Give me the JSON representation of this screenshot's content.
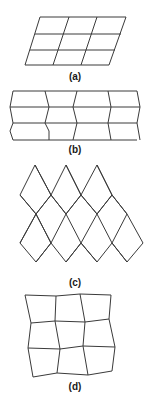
{
  "figure": {
    "panels": [
      {
        "id": "a",
        "label": "(a)",
        "description": "3x3 grid of parallelograms (sheared lattice)",
        "label_pos": [
          75,
          77
        ],
        "lines": [
          [
            [
              40,
              17
            ],
            [
              126,
              17
            ]
          ],
          [
            [
              35,
              34
            ],
            [
              121,
              34
            ]
          ],
          [
            [
              30,
              50
            ],
            [
              115,
              50
            ]
          ],
          [
            [
              25,
              65
            ],
            [
              109,
              65
            ]
          ],
          [
            [
              40,
              17
            ],
            [
              25,
              65
            ]
          ],
          [
            [
              69,
              17
            ],
            [
              53,
              65
            ]
          ],
          [
            [
              97,
              17
            ],
            [
              81,
              65
            ]
          ],
          [
            [
              126,
              17
            ],
            [
              109,
              65
            ]
          ]
        ]
      },
      {
        "id": "b",
        "label": "(b)",
        "description": "3x4 grid with zigzag (re-entrant) vertical edges",
        "label_pos": [
          75,
          150
        ],
        "lines": [
          [
            [
              13,
              91
            ],
            [
              137,
              91
            ]
          ],
          [
            [
              10,
              107
            ],
            [
              140,
              107
            ]
          ],
          [
            [
              13,
              123
            ],
            [
              137,
              123
            ]
          ],
          [
            [
              13,
              140
            ],
            [
              137,
              140
            ]
          ],
          [
            [
              13,
              91
            ],
            [
              10,
              107
            ],
            [
              13,
              123
            ],
            [
              10,
              131
            ],
            [
              13,
              140
            ]
          ],
          [
            [
              45,
              91
            ],
            [
              49,
              107
            ],
            [
              45,
              123
            ],
            [
              49,
              131
            ],
            [
              49,
              140
            ]
          ],
          [
            [
              77,
              91
            ],
            [
              73,
              107
            ],
            [
              77,
              123
            ],
            [
              73,
              140
            ]
          ],
          [
            [
              108,
              91
            ],
            [
              111,
              107
            ],
            [
              108,
              123
            ],
            [
              111,
              140
            ]
          ],
          [
            [
              137,
              91
            ],
            [
              140,
              107
            ],
            [
              137,
              123
            ],
            [
              140,
              140
            ]
          ]
        ]
      },
      {
        "id": "c",
        "label": "(c)",
        "description": "Rhombic (diamond) lattice",
        "label_pos": [
          75,
          283
        ],
        "polylines": [
          [
            [
              20,
              195
            ],
            [
              35,
              165
            ],
            [
              51,
              195
            ],
            [
              66,
              165
            ],
            [
              81,
              195
            ],
            [
              97,
              165
            ],
            [
              112,
              195
            ],
            [
              127,
              214
            ],
            [
              143,
              243
            ],
            [
              127,
              262
            ],
            [
              112,
              243
            ],
            [
              97,
              262
            ],
            [
              81,
              243
            ],
            [
              66,
              262
            ],
            [
              51,
              243
            ],
            [
              36,
              262
            ],
            [
              20,
              243
            ],
            [
              36,
              214
            ],
            [
              20,
              195
            ]
          ],
          [
            [
              20,
              195
            ],
            [
              36,
              214
            ],
            [
              51,
              243
            ]
          ],
          [
            [
              35,
              165
            ],
            [
              51,
              195
            ],
            [
              66,
              214
            ],
            [
              81,
              243
            ],
            [
              97,
              262
            ]
          ],
          [
            [
              66,
              165
            ],
            [
              81,
              195
            ],
            [
              97,
              214
            ],
            [
              112,
              243
            ],
            [
              127,
              262
            ]
          ],
          [
            [
              97,
              165
            ],
            [
              112,
              195
            ]
          ],
          [
            [
              51,
              195
            ],
            [
              36,
              214
            ]
          ],
          [
            [
              81,
              195
            ],
            [
              66,
              214
            ],
            [
              51,
              243
            ]
          ],
          [
            [
              112,
              195
            ],
            [
              97,
              214
            ],
            [
              81,
              243
            ],
            [
              66,
              262
            ]
          ],
          [
            [
              127,
              214
            ],
            [
              112,
              243
            ]
          ],
          [
            [
              36,
              214
            ],
            [
              51,
              243
            ],
            [
              36,
              262
            ]
          ],
          [
            [
              20,
              243
            ],
            [
              36,
              214
            ]
          ],
          [
            [
              36,
              214
            ],
            [
              51,
              195
            ]
          ],
          [
            [
              66,
              214
            ],
            [
              81,
              195
            ]
          ],
          [
            [
              97,
              214
            ],
            [
              112,
              195
            ]
          ],
          [
            [
              51,
              195
            ],
            [
              66,
              214
            ]
          ],
          [
            [
              81,
              195
            ],
            [
              97,
              214
            ]
          ],
          [
            [
              112,
              195
            ],
            [
              127,
              214
            ]
          ]
        ]
      },
      {
        "id": "d",
        "label": "(d)",
        "description": "Irregularly distorted 3x3 quadrilateral grid",
        "label_pos": [
          75,
          387
        ],
        "rows": [
          [
            [
              25,
              295
            ],
            [
              56,
              296
            ],
            [
              80,
              294
            ],
            [
              111,
              295
            ]
          ],
          [
            [
              31,
              323
            ],
            [
              55,
              321
            ],
            [
              85,
              322
            ],
            [
              109,
              319
            ]
          ],
          [
            [
              28,
              348
            ],
            [
              60,
              349
            ],
            [
              83,
              346
            ],
            [
              115,
              347
            ]
          ],
          [
            [
              33,
              377
            ],
            [
              57,
              373
            ],
            [
              88,
              375
            ],
            [
              112,
              371
            ]
          ]
        ]
      }
    ],
    "stroke_color": "#3a3a3a",
    "label_color": "#1a1a1a",
    "background": "#ffffff"
  }
}
